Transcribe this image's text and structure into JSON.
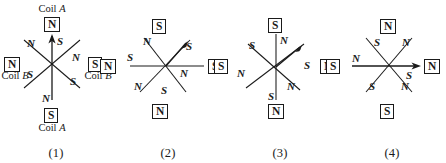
{
  "figure": {
    "ink_color": "#1a1a1a",
    "background": "#ffffff"
  },
  "panels": [
    {
      "caption": "(1)",
      "arrow": "up",
      "boxes": {
        "top": "N",
        "bottom": "S",
        "left": "N",
        "right": "S"
      },
      "coil_labels": {
        "top": "Coil A",
        "bottom": "Coil A",
        "left": "Coil B",
        "right": "Coil B"
      },
      "poles": {
        "up": "S",
        "down": "N",
        "up_left": "N",
        "down_left": "S",
        "up_right": "N",
        "down_right": "S"
      }
    },
    {
      "caption": "(2)",
      "arrow": "up-right",
      "boxes": {
        "top": "S",
        "bottom": "N",
        "left": "N",
        "right": "S"
      },
      "coil_labels": {
        "top": "",
        "bottom": "",
        "left": "",
        "right": ""
      },
      "poles": {
        "up_left": "N",
        "down_right": "S",
        "left": "S",
        "right": "N",
        "down_left": "N",
        "up_right": "S"
      }
    },
    {
      "caption": "(3)",
      "arrow": "up-right",
      "boxes": {
        "top": "S",
        "bottom": "N",
        "left": "S",
        "right": "N"
      },
      "coil_labels": {
        "top": "",
        "bottom": "",
        "left": "",
        "right": ""
      },
      "poles": {
        "up": "N",
        "down": "S",
        "up_left": "S",
        "down_right": "N",
        "left": "N",
        "up_right": "S"
      }
    },
    {
      "caption": "(4)",
      "arrow": "right",
      "boxes": {
        "top": "N",
        "bottom": "S",
        "left": "S",
        "right": "N"
      },
      "coil_labels": {
        "top": "",
        "bottom": "",
        "left": "",
        "right": ""
      },
      "poles": {
        "up_left": "S",
        "down_right": "N",
        "up_right": "N",
        "down_left": "S",
        "left": "N",
        "right": "S"
      }
    }
  ]
}
